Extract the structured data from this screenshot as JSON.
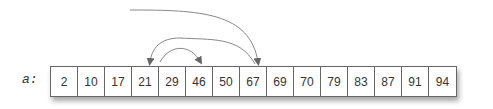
{
  "array": {
    "name": "a:",
    "values": [
      2,
      10,
      17,
      21,
      29,
      46,
      50,
      67,
      69,
      70,
      79,
      83,
      87,
      91,
      94
    ]
  },
  "arrows": [
    {
      "from": "outside",
      "to_index": 7,
      "to_value": 67
    },
    {
      "from_index": 7,
      "to_index": 3,
      "to_value": 21
    },
    {
      "from_index": 4,
      "to_index": 5,
      "to_value": 46
    }
  ],
  "colors": {
    "arrow": "#777777",
    "border": "#666666",
    "text": "#333333"
  }
}
